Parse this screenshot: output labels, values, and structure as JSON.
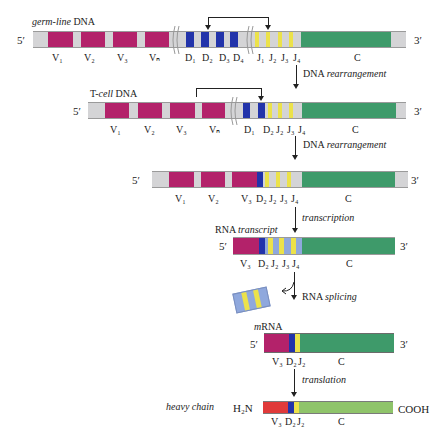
{
  "colors": {
    "v_segment": "#b3226a",
    "d_segment": "#2233aa",
    "j_segment": "#ece24a",
    "c_segment": "#3e9a6a",
    "spacer": "#d4d4d6",
    "rna_spacer": "#8fa8dd",
    "protein_v": "#e03a3a",
    "protein_c": "#8fc46a"
  },
  "rows": {
    "germline": {
      "title_italic": "germ-line",
      "title_rest": " DNA",
      "five_prime": "5′",
      "three_prime": "3′",
      "labels": [
        "V₁",
        "V₂",
        "V₃",
        "Vₙ",
        "D₁",
        "D₂",
        "D₃",
        "D₄",
        "J₁",
        "J₂",
        "J₃",
        "J₄",
        "C"
      ]
    },
    "tcell": {
      "title_pre": "T-",
      "title_italic": "cell",
      "title_rest": " DNA",
      "five_prime": "5′",
      "three_prime": "3′",
      "labels": [
        "V₁",
        "V₂",
        "V₃",
        "Vₙ",
        "D₁",
        "D₂",
        "J₂",
        "J₃",
        "J₄",
        "C"
      ]
    },
    "rearranged": {
      "five_prime": "5′",
      "three_prime": "3′",
      "labels": [
        "V₁",
        "V₂",
        "V₃",
        "D₂",
        "J₂",
        "J₃",
        "J₄",
        "C"
      ]
    },
    "rna": {
      "title_pre": "RNA ",
      "title_italic": "transcript",
      "five_prime": "5′",
      "three_prime": "3′",
      "labels": [
        "V₃",
        "D₂",
        "J₂",
        "J₃",
        "J₄",
        "C"
      ]
    },
    "mrna": {
      "title_italic": "m",
      "title_rest": "RNA",
      "five_prime": "5′",
      "three_prime": "3′",
      "labels": [
        "V₃",
        "D₂",
        "J₂",
        "C"
      ]
    },
    "protein": {
      "title": "heavy chain",
      "n_term": "H₂N",
      "c_term": "COOH",
      "labels": [
        "V₃",
        "D₂",
        "J₂",
        "C"
      ]
    }
  },
  "steps": {
    "step1": {
      "pre": "DNA ",
      "italic": "rearrangement"
    },
    "step2": {
      "pre": "DNA ",
      "italic": "rearrangement"
    },
    "step3": {
      "pre": "",
      "italic": "transcription"
    },
    "step4": {
      "pre": "RNA ",
      "italic": "splicing"
    },
    "step5": {
      "pre": "",
      "italic": "translation"
    }
  }
}
